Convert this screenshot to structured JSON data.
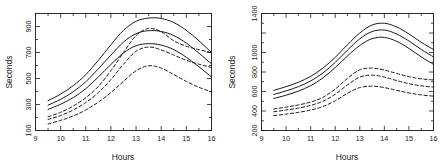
{
  "figure": {
    "background": "#ffffff",
    "line_color": "#1a1a1a",
    "panel_count": 2
  },
  "chart_data": [
    {
      "panel": "left",
      "type": "line",
      "title": "",
      "xlabel": "Hours",
      "ylabel": "Seconds",
      "xlim": [
        9,
        16
      ],
      "ylim": [
        100,
        1000
      ],
      "xticks": [
        9,
        10,
        11,
        12,
        13,
        14,
        15,
        16
      ],
      "xticklabels": [
        "9",
        "10",
        "11",
        "12",
        "13",
        "14",
        "15",
        "16"
      ],
      "yticks": [
        100,
        300,
        500,
        700,
        900
      ],
      "yticklabels": [
        "100",
        "300",
        "500",
        "700",
        "900"
      ],
      "grid": false,
      "legend": "none",
      "x": [
        9.5,
        10.0,
        10.5,
        11.0,
        11.5,
        12.0,
        12.5,
        13.0,
        13.5,
        14.0,
        14.5,
        15.0,
        15.5,
        16.0
      ],
      "series": [
        {
          "name": "solid-upper",
          "style": "solid",
          "values": [
            330,
            380,
            445,
            530,
            640,
            760,
            870,
            940,
            965,
            962,
            930,
            870,
            790,
            700
          ]
        },
        {
          "name": "solid-middle",
          "style": "solid",
          "values": [
            295,
            340,
            398,
            475,
            575,
            680,
            780,
            845,
            868,
            862,
            830,
            772,
            695,
            612
          ]
        },
        {
          "name": "solid-lower",
          "style": "solid",
          "values": [
            262,
            302,
            353,
            422,
            512,
            608,
            697,
            752,
            768,
            757,
            722,
            663,
            590,
            512
          ]
        },
        {
          "name": "dashed-upper",
          "style": "dashed",
          "values": [
            205,
            240,
            288,
            352,
            440,
            560,
            700,
            830,
            885,
            860,
            790,
            748,
            722,
            700
          ]
        },
        {
          "name": "dashed-middle",
          "style": "dashed",
          "values": [
            185,
            215,
            258,
            315,
            392,
            492,
            610,
            710,
            742,
            720,
            680,
            640,
            610,
            585
          ]
        },
        {
          "name": "dashed-lower",
          "style": "dashed",
          "values": [
            150,
            178,
            212,
            258,
            318,
            392,
            478,
            560,
            598,
            580,
            530,
            478,
            432,
            398
          ]
        }
      ]
    },
    {
      "panel": "right",
      "type": "line",
      "title": "",
      "xlabel": "Hours",
      "ylabel": "Seconds",
      "xlim": [
        9,
        16
      ],
      "ylim": [
        200,
        1400
      ],
      "xticks": [
        9,
        10,
        11,
        12,
        13,
        14,
        15,
        16
      ],
      "xticklabels": [
        "9",
        "10",
        "11",
        "12",
        "13",
        "14",
        "15",
        "16"
      ],
      "yticks": [
        200,
        400,
        600,
        800,
        1000,
        1200,
        1400
      ],
      "yticklabels": [
        "200",
        "400",
        "600",
        "800",
        "1000",
        "",
        "1400"
      ],
      "grid": false,
      "legend": "none",
      "x": [
        9.5,
        10.0,
        10.5,
        11.0,
        11.5,
        12.0,
        12.5,
        13.0,
        13.5,
        14.0,
        14.5,
        15.0,
        15.5,
        16.0
      ],
      "series": [
        {
          "name": "solid-upper",
          "style": "solid",
          "values": [
            612,
            650,
            695,
            755,
            840,
            950,
            1080,
            1200,
            1282,
            1300,
            1262,
            1190,
            1105,
            1030
          ]
        },
        {
          "name": "solid-middle",
          "style": "solid",
          "values": [
            570,
            606,
            650,
            708,
            790,
            898,
            1025,
            1140,
            1215,
            1230,
            1190,
            1118,
            1032,
            955
          ]
        },
        {
          "name": "solid-lower",
          "style": "solid",
          "values": [
            528,
            562,
            604,
            660,
            740,
            845,
            965,
            1072,
            1142,
            1155,
            1115,
            1042,
            955,
            878
          ]
        },
        {
          "name": "dashed-upper",
          "style": "dashed",
          "values": [
            420,
            440,
            462,
            492,
            540,
            625,
            735,
            822,
            840,
            820,
            785,
            752,
            730,
            718
          ]
        },
        {
          "name": "dashed-middle",
          "style": "dashed",
          "values": [
            392,
            410,
            430,
            458,
            500,
            572,
            668,
            748,
            768,
            748,
            712,
            680,
            658,
            645
          ]
        },
        {
          "name": "dashed-lower",
          "style": "dashed",
          "values": [
            352,
            368,
            386,
            410,
            446,
            505,
            582,
            640,
            655,
            640,
            612,
            585,
            565,
            552
          ]
        }
      ]
    }
  ]
}
